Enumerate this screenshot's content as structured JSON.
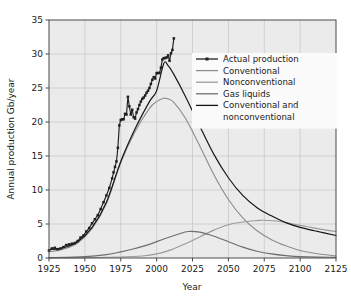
{
  "chart_data": {
    "type": "line",
    "title": "",
    "xlabel": "Year",
    "ylabel": "Annual production Gb/year",
    "xlim": [
      1925,
      2125
    ],
    "ylim": [
      0,
      35
    ],
    "xticks": [
      1925,
      1950,
      1975,
      2000,
      2025,
      2050,
      2075,
      2100,
      2125
    ],
    "yticks": [
      0,
      5,
      10,
      15,
      20,
      25,
      30,
      35
    ],
    "grid": true,
    "legend_position": "upper right",
    "series": [
      {
        "name": "Actual production",
        "color": "#1f1f1f",
        "marker": "square",
        "x": [
          1925,
          1927,
          1929,
          1931,
          1933,
          1935,
          1937,
          1939,
          1941,
          1943,
          1945,
          1947,
          1949,
          1951,
          1953,
          1955,
          1957,
          1959,
          1961,
          1963,
          1965,
          1967,
          1969,
          1970,
          1971,
          1972,
          1973,
          1974,
          1975,
          1976,
          1977,
          1978,
          1979,
          1980,
          1981,
          1982,
          1983,
          1984,
          1985,
          1986,
          1987,
          1988,
          1989,
          1990,
          1991,
          1992,
          1993,
          1994,
          1995,
          1996,
          1997,
          1998,
          1999,
          2000,
          2001,
          2002,
          2003,
          2004,
          2005,
          2006,
          2007,
          2008,
          2009,
          2010,
          2011,
          2012
        ],
        "values": [
          1.1,
          1.4,
          1.5,
          1.3,
          1.4,
          1.6,
          1.9,
          2.0,
          2.1,
          2.2,
          2.5,
          3.0,
          3.3,
          3.9,
          4.4,
          5.1,
          5.7,
          6.3,
          7.2,
          8.2,
          9.2,
          10.3,
          11.7,
          12.6,
          13.4,
          14.2,
          16.2,
          19.5,
          20.3,
          20.4,
          20.4,
          21.2,
          21.1,
          23.7,
          22.3,
          21.1,
          21.8,
          20.7,
          20.5,
          21.4,
          21.9,
          22.5,
          23.0,
          23.4,
          23.6,
          23.9,
          24.3,
          24.6,
          25.0,
          25.6,
          26.2,
          26.6,
          26.4,
          27.2,
          27.2,
          27.2,
          28.0,
          29.2,
          29.4,
          29.4,
          29.5,
          29.8,
          29.0,
          30.1,
          30.6,
          32.3
        ]
      },
      {
        "name": "Conventional",
        "color": "#8e8e8e",
        "x": [
          1925,
          1935,
          1945,
          1955,
          1965,
          1975,
          1985,
          1995,
          2000,
          2005,
          2008,
          2012,
          2020,
          2030,
          2040,
          2050,
          2060,
          2070,
          2080,
          2090,
          2100,
          2110,
          2125
        ],
        "values": [
          0.9,
          1.3,
          2.2,
          4.3,
          8.0,
          14.0,
          18.6,
          22.0,
          23.0,
          23.5,
          23.4,
          22.9,
          20.6,
          16.5,
          12.2,
          8.6,
          5.9,
          4.0,
          2.7,
          1.8,
          1.1,
          0.7,
          0.3
        ]
      },
      {
        "name": "Nonconventional",
        "color": "#9a9a9a",
        "x": [
          1925,
          1950,
          1975,
          1990,
          2000,
          2010,
          2020,
          2030,
          2040,
          2050,
          2060,
          2070,
          2075,
          2085,
          2095,
          2105,
          2115,
          2125
        ],
        "values": [
          0.0,
          0.05,
          0.15,
          0.3,
          0.6,
          1.2,
          2.1,
          3.1,
          4.1,
          4.9,
          5.3,
          5.5,
          5.55,
          5.4,
          5.0,
          4.6,
          4.2,
          3.9
        ]
      },
      {
        "name": "Gas liquids",
        "color": "#6e6e6e",
        "x": [
          1925,
          1950,
          1965,
          1975,
          1985,
          1995,
          2005,
          2015,
          2022,
          2030,
          2040,
          2050,
          2060,
          2070,
          2080,
          2090,
          2100,
          2125
        ],
        "values": [
          0.05,
          0.2,
          0.5,
          0.9,
          1.4,
          2.0,
          2.8,
          3.5,
          3.9,
          3.8,
          3.2,
          2.4,
          1.6,
          1.0,
          0.6,
          0.35,
          0.2,
          0.1
        ]
      },
      {
        "name": "Conventional and nonconventional",
        "color": "#141414",
        "x": [
          1925,
          1935,
          1945,
          1955,
          1965,
          1975,
          1985,
          1995,
          2000,
          2005,
          2008,
          2012,
          2020,
          2030,
          2040,
          2050,
          2060,
          2070,
          2080,
          2090,
          2100,
          2110,
          2125
        ],
        "values": [
          1.2,
          1.5,
          2.4,
          4.5,
          8.2,
          14.2,
          19.0,
          23.0,
          24.6,
          28.6,
          28.3,
          27.0,
          23.8,
          19.4,
          15.2,
          11.8,
          9.2,
          7.4,
          6.2,
          5.2,
          4.5,
          4.0,
          3.3
        ]
      }
    ],
    "legend": [
      {
        "label": "Actual production",
        "color": "#1f1f1f",
        "marker": true
      },
      {
        "label": "Conventional",
        "color": "#8e8e8e",
        "marker": false
      },
      {
        "label": "Nonconventional",
        "color": "#9a9a9a",
        "marker": false
      },
      {
        "label": "Gas liquids",
        "color": "#6e6e6e",
        "marker": false
      },
      {
        "label": "Conventional and",
        "label2": "nonconventional",
        "color": "#141414",
        "marker": false
      }
    ]
  },
  "style": {
    "plot_background": "#ebebeb",
    "legend_background": "#fbfbfb",
    "grid_color": "#c9c9c9",
    "axis_color": "#4a4a4a",
    "text_color": "#1a1a1a",
    "page_background": "#ffffff"
  }
}
